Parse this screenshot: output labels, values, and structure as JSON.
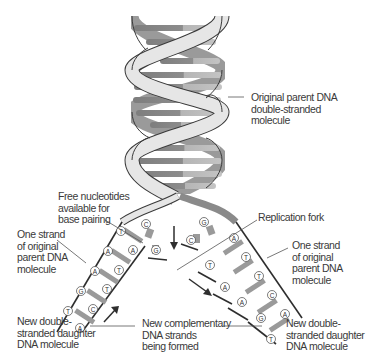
{
  "diagram": {
    "colors": {
      "backbone_light": "#e4e4e4",
      "backbone_mid": "#9a9a9a",
      "base_dark": "#8a8a8a",
      "base_light": "#b8b8b8",
      "outline": "#3a3a3a",
      "text": "#3a3a3a"
    },
    "labels": {
      "original_parent": [
        "Original parent DNA",
        "double-stranded",
        "molecule"
      ],
      "free_nucleotides": [
        "Free nucleotides",
        "available for",
        "base pairing"
      ],
      "replication_fork": [
        "Replication fork"
      ],
      "one_strand_left": [
        "One strand",
        "of original",
        "parent DNA",
        "molecule"
      ],
      "one_strand_right": [
        "One strand",
        "of original",
        "parent DNA",
        "molecule"
      ],
      "new_daughter_left": [
        "New double-",
        "stranded daughter",
        "DNA molecule"
      ],
      "new_complementary": [
        "New complementary",
        "DNA strands",
        "being formed"
      ],
      "new_daughter_right": [
        "New double-",
        "stranded daughter",
        "DNA molecule"
      ]
    },
    "left_arm_bases": {
      "outer": [
        "T",
        "A",
        "A",
        "G",
        "T"
      ],
      "inner": [
        "A",
        "T",
        "T",
        "C",
        "A"
      ]
    },
    "right_arm_bases": {
      "outer": [
        "A",
        "T",
        "T",
        "C",
        "A"
      ],
      "inner": [
        "T",
        "A",
        "A",
        "G",
        "T"
      ]
    },
    "free_nucleotides": [
      "C",
      "G",
      "G",
      "C"
    ]
  }
}
